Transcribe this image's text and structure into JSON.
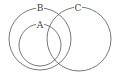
{
  "diagram": {
    "type": "venn",
    "background": "#ffffff",
    "stroke_color": "#555555",
    "sets": [
      {
        "label": "B",
        "cx": 40,
        "cy": 39,
        "r": 31,
        "label_x": 40,
        "label_y": 8
      },
      {
        "label": "A",
        "cx": 40,
        "cy": 45,
        "r": 21,
        "label_x": 40,
        "label_y": 25
      },
      {
        "label": "C",
        "cx": 79,
        "cy": 39,
        "r": 32,
        "label_x": 78,
        "label_y": 8
      }
    ]
  }
}
